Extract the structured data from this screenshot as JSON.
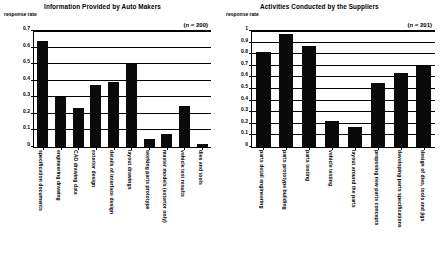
{
  "chart_data": [
    {
      "type": "bar",
      "title": "Information Provided by Auto Makers",
      "ylabel": "response rate",
      "annotation": "(n = 200)",
      "xlabel": "",
      "ylim": [
        0,
        0.7
      ],
      "ytick_labels": [
        "0",
        "0.1",
        "0.2",
        "0.3",
        "0.4",
        "0.5",
        "0.6",
        "0.7"
      ],
      "ytick_values": [
        0,
        0.1,
        0.2,
        0.3,
        0.4,
        0.5,
        0.6,
        0.7
      ],
      "grid": true,
      "legend": "none",
      "bar_color": "#0a0a0a",
      "categories": [
        "specification documents",
        "engineering drawing",
        "CAD drawing data",
        "exterior design",
        "details of interface design",
        "layout drawings",
        "working parts prototype",
        "master models (exterior only)",
        "vehicle test results",
        "dies and tools"
      ],
      "values": [
        0.64,
        0.3,
        0.235,
        0.375,
        0.395,
        0.5,
        0.05,
        0.08,
        0.25,
        0.02
      ]
    },
    {
      "type": "bar",
      "title": "Activities Conducted by the Suppliers",
      "ylabel": "response rate",
      "annotation": "(n = 201)",
      "xlabel": "",
      "ylim": [
        0,
        1
      ],
      "ytick_labels": [
        "0",
        "0.1",
        "0.2",
        "0.3",
        "0.4",
        "0.5",
        "0.6",
        "0.7",
        "0.8",
        "0.9",
        "1"
      ],
      "ytick_values": [
        0,
        0.1,
        0.2,
        0.3,
        0.4,
        0.5,
        0.6,
        0.7,
        0.8,
        0.9,
        1
      ],
      "grid": true,
      "legend": "none",
      "bar_color": "#0a0a0a",
      "categories": [
        "parts detail engineering",
        "parts prototype building",
        "parts testing",
        "vehicle testing",
        "layout around the parts",
        "proposing new parts concepts",
        "developing parts specifications",
        "design of dies, tools and jigs"
      ],
      "values": [
        0.82,
        0.97,
        0.87,
        0.22,
        0.17,
        0.55,
        0.64,
        0.7
      ]
    }
  ]
}
